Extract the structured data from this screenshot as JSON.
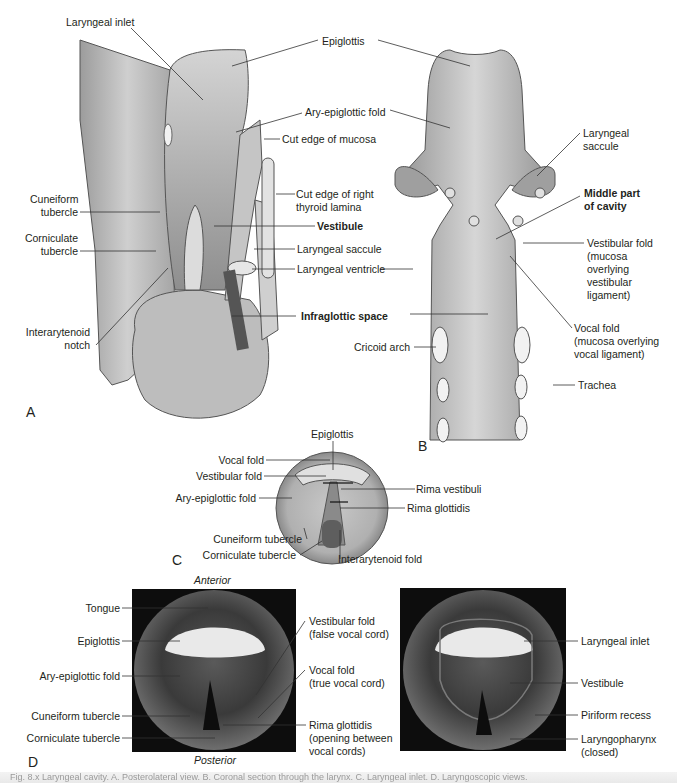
{
  "figure": {
    "panels": {
      "A": {
        "letter": "A",
        "labels": {
          "laryngeal_inlet": "Laryngeal inlet",
          "epiglottis": "Epiglottis",
          "ary_epiglottic_fold": "Ary-epiglottic fold",
          "cut_edge_mucosa": "Cut edge of mucosa",
          "cut_edge_thyroid_1": "Cut edge of right",
          "cut_edge_thyroid_2": "thyroid lamina",
          "cuneiform_1": "Cuneiform",
          "cuneiform_2": "tubercle",
          "corniculate_1": "Corniculate",
          "corniculate_2": "tubercle",
          "vestibule": "Vestibule",
          "laryngeal_saccule": "Laryngeal saccule",
          "laryngeal_ventricle": "Laryngeal ventricle",
          "infraglottic_space": "Infraglottic space",
          "interarytenoid_1": "Interarytenoid",
          "interarytenoid_2": "notch"
        }
      },
      "B": {
        "letter": "B",
        "labels": {
          "laryngeal_saccule_1": "Laryngeal",
          "laryngeal_saccule_2": "saccule",
          "middle_part_1": "Middle part",
          "middle_part_2": "of cavity",
          "vestibular_fold": [
            "Vestibular fold",
            "(mucosa",
            "overlying",
            "vestibular",
            "ligament)"
          ],
          "vocal_fold": [
            "Vocal fold",
            "(mucosa overlying",
            "vocal ligament)"
          ],
          "cricoid_arch": "Cricoid arch",
          "trachea": "Trachea"
        }
      },
      "C": {
        "letter": "C",
        "labels": {
          "epiglottis": "Epiglottis",
          "vocal_fold": "Vocal fold",
          "vestibular_fold": "Vestibular fold",
          "ary_epiglottic_fold": "Ary-epiglottic fold",
          "cuneiform_tubercle": "Cuneiform tubercle",
          "corniculate_tubercle": "Corniculate tubercle",
          "rima_vestibuli": "Rima vestibuli",
          "rima_glottidis": "Rima glottidis",
          "interarytenoid_fold": "Interarytenoid fold"
        }
      },
      "D": {
        "letter": "D",
        "orientation": {
          "top": "Anterior",
          "bottom": "Posterior"
        },
        "left_labels": {
          "tongue": "Tongue",
          "epiglottis": "Epiglottis",
          "ary_epiglottic_fold": "Ary-epiglottic fold",
          "cuneiform_tubercle": "Cuneiform tubercle",
          "corniculate_tubercle": "Corniculate tubercle"
        },
        "middle_labels": {
          "vestibular_fold": [
            "Vestibular fold",
            "(false vocal cord)"
          ],
          "vocal_fold": [
            "Vocal fold",
            "(true vocal cord)"
          ],
          "rima_glottidis": [
            "Rima glottidis",
            "(opening between",
            "vocal cords)"
          ]
        },
        "right_labels": {
          "laryngeal_inlet": "Laryngeal inlet",
          "vestibule": "Vestibule",
          "piriform_recess": "Piriform recess",
          "laryngopharynx": [
            "Laryngopharynx",
            "(closed)"
          ]
        }
      }
    },
    "caption_partial": "Fig. 8.x  Laryngeal cavity. A. Posterolateral view. B. Coronal section through the larynx. C. Laryngeal inlet. D. Laryngoscopic views."
  },
  "colors": {
    "tissue_light": "#d9d9d9",
    "tissue_mid": "#b5b5b5",
    "tissue_dark": "#7d7d7d",
    "line": "#333333",
    "photo_bg": "#0d0d0d"
  }
}
